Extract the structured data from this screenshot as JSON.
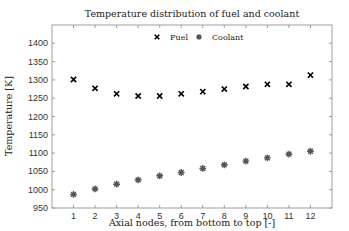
{
  "chart_data": {
    "type": "scatter",
    "title": "Temperature distribution of fuel and coolant",
    "xlabel": "Axial nodes, from bottom to top [-]",
    "ylabel": "Temperature [K]",
    "x": [
      1,
      2,
      3,
      4,
      5,
      6,
      7,
      8,
      9,
      10,
      11,
      12
    ],
    "xlim": [
      0,
      13
    ],
    "ylim": [
      950,
      1450
    ],
    "xticks": [
      1,
      2,
      3,
      4,
      5,
      6,
      7,
      8,
      9,
      10,
      11,
      12
    ],
    "yticks": [
      950,
      1000,
      1050,
      1100,
      1150,
      1200,
      1250,
      1300,
      1350,
      1400
    ],
    "grid": false,
    "legend_position": "top-center",
    "series": [
      {
        "name": "Fuel",
        "marker": "x",
        "color": "#000000",
        "values": [
          1301,
          1277,
          1262,
          1256,
          1256,
          1262,
          1268,
          1275,
          1282,
          1288,
          1288,
          1313
        ]
      },
      {
        "name": "Coolant",
        "marker": "asterisk",
        "color": "#555555",
        "values": [
          987,
          1002,
          1015,
          1027,
          1038,
          1047,
          1058,
          1068,
          1078,
          1087,
          1097,
          1105
        ]
      }
    ]
  }
}
